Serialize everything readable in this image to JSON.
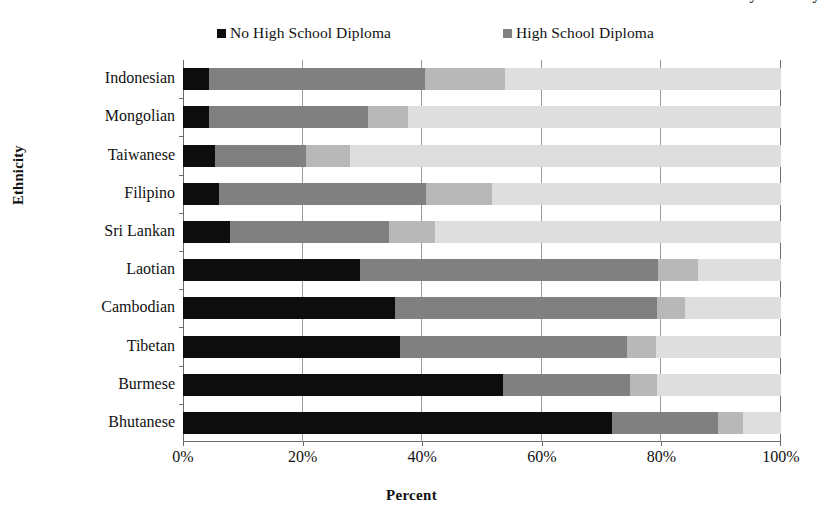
{
  "title_cutoff": "Educational Attainment by Ethnicity",
  "axis": {
    "ylabel": "Ethnicity",
    "xlabel": "Percent",
    "xticks": [
      "0%",
      "20%",
      "40%",
      "60%",
      "80%",
      "100%"
    ]
  },
  "legend": {
    "items": [
      {
        "label": "No High School Diploma",
        "color": "#0d0d0d"
      },
      {
        "label": "High School Diploma",
        "color": "#808080"
      }
    ]
  },
  "chart_data": {
    "type": "bar",
    "orientation": "horizontal",
    "stacked": true,
    "normalized": true,
    "title": "Educational Attainment by Ethnicity",
    "xlabel": "Percent",
    "ylabel": "Ethnicity",
    "xlim": [
      0,
      100
    ],
    "xtick_values": [
      0,
      20,
      40,
      60,
      80,
      100
    ],
    "xtick_labels": [
      "0%",
      "20%",
      "40%",
      "60%",
      "80%",
      "100%"
    ],
    "grid": "vertical",
    "legend_position": "top",
    "categories": [
      "Indonesian",
      "Mongolian",
      "Taiwanese",
      "Filipino",
      "Sri Lankan",
      "Laotian",
      "Cambodian",
      "Tibetan",
      "Burmese",
      "Bhutanese"
    ],
    "series": [
      {
        "name": "No High School Diploma",
        "color": "#0d0d0d",
        "values": [
          4.3,
          4.3,
          5.3,
          6.1,
          7.8,
          29.6,
          35.5,
          36.3,
          53.5,
          71.7
        ]
      },
      {
        "name": "High School Diploma",
        "color": "#808080",
        "values": [
          36.2,
          26.7,
          15.2,
          34.5,
          26.6,
          49.8,
          43.8,
          38.0,
          21.2,
          17.8
        ]
      },
      {
        "name": "Series 3",
        "color": "#b8b8b8",
        "values": [
          13.3,
          6.6,
          7.4,
          11.1,
          7.7,
          6.8,
          4.7,
          4.8,
          4.6,
          4.1
        ]
      },
      {
        "name": "Series 4",
        "color": "#dedede",
        "values": [
          46.2,
          62.4,
          72.1,
          48.3,
          57.9,
          13.8,
          16.0,
          20.9,
          20.7,
          6.4
        ]
      }
    ],
    "segment_cumulative_pct": [
      {
        "category": "Indonesian",
        "stops": [
          4.3,
          40.5,
          53.8,
          100
        ]
      },
      {
        "category": "Mongolian",
        "stops": [
          4.3,
          31.0,
          37.6,
          100
        ]
      },
      {
        "category": "Taiwanese",
        "stops": [
          5.3,
          20.5,
          27.9,
          100
        ]
      },
      {
        "category": "Filipino",
        "stops": [
          6.1,
          40.6,
          51.7,
          100
        ]
      },
      {
        "category": "Sri Lankan",
        "stops": [
          7.8,
          34.4,
          42.1,
          100
        ]
      },
      {
        "category": "Laotian",
        "stops": [
          29.6,
          79.4,
          86.2,
          100
        ]
      },
      {
        "category": "Cambodian",
        "stops": [
          35.5,
          79.3,
          84.0,
          100
        ]
      },
      {
        "category": "Tibetan",
        "stops": [
          36.3,
          74.3,
          79.1,
          100
        ]
      },
      {
        "category": "Burmese",
        "stops": [
          53.5,
          74.7,
          79.3,
          100
        ]
      },
      {
        "category": "Bhutanese",
        "stops": [
          71.7,
          89.5,
          93.6,
          100
        ]
      }
    ]
  }
}
